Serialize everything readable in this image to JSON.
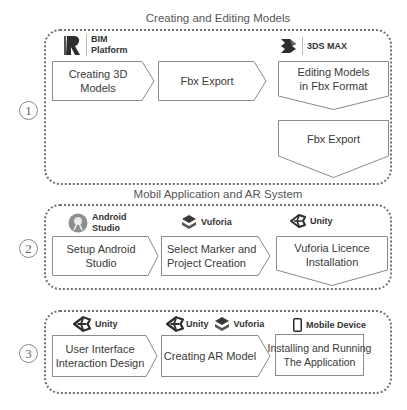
{
  "sections": [
    {
      "title": "Creating and Editing Models",
      "number": "1",
      "tools": [
        {
          "icon": "bim-platform-icon",
          "label_line1": "BIM",
          "label_line2": "Platform"
        },
        {
          "icon": "3ds-max-icon",
          "label": "3DS MAX"
        }
      ],
      "steps": [
        {
          "line1": "Creating 3D",
          "line2": "Models",
          "shape": "arrow-right"
        },
        {
          "line1": "Fbx Export",
          "shape": "arrow-right"
        },
        {
          "line1": "Editing Models",
          "line2": "in Fbx Format",
          "shape": "arrow-down"
        },
        {
          "line1": "Fbx Export",
          "shape": "arrow-down"
        }
      ]
    },
    {
      "title": "Mobil Application and AR System",
      "number": "2",
      "tools": [
        {
          "icon": "android-studio-icon",
          "label_line1": "Android",
          "label_line2": "Studio"
        },
        {
          "icon": "vuforia-icon",
          "label": "Vuforia"
        },
        {
          "icon": "unity-icon",
          "label": "Unity"
        }
      ],
      "steps": [
        {
          "line1": "Setup Android Studio",
          "shape": "arrow-right"
        },
        {
          "line1": "Select Marker and",
          "line2": "Project Creation",
          "shape": "arrow-right"
        },
        {
          "line1": "Vuforia Licence",
          "line2": "Installation",
          "shape": "arrow-down"
        }
      ]
    },
    {
      "number": "3",
      "tools": [
        {
          "icon": "unity-icon",
          "label": "Unity"
        },
        {
          "icon": "unity-icon",
          "label": "Unity",
          "icon2": "vuforia-icon",
          "label2": "Vuforia"
        },
        {
          "icon": "mobile-device-icon",
          "label": "Mobile Device"
        }
      ],
      "steps": [
        {
          "line1": "User Interface",
          "line2": "Interaction Design",
          "shape": "arrow-right"
        },
        {
          "line1": "Creating AR Model",
          "shape": "arrow-right"
        },
        {
          "line1": "Installing and Running",
          "line2": "The Application",
          "shape": "rectangle"
        }
      ]
    }
  ],
  "colors": {
    "border": "#707070",
    "shape_stroke": "#8a8a8a",
    "text": "#3a3a3a",
    "icon": "#3a3a3a"
  }
}
